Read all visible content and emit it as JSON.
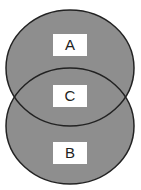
{
  "diagram": {
    "type": "venn",
    "regions": [
      {
        "id": "A",
        "label": "A"
      },
      {
        "id": "C",
        "label": "C"
      },
      {
        "id": "B",
        "label": "B"
      }
    ],
    "fill_color": "#8c8c8c",
    "stroke_color": "#222222"
  }
}
